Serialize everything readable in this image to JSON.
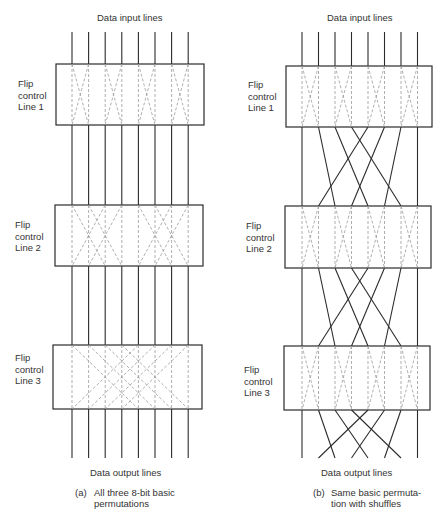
{
  "panels": [
    {
      "id": "a",
      "input_label": "Data input lines",
      "output_label": "Data output lines",
      "caption_tag": "(a)",
      "caption_line1": "All three 8-bit basic",
      "caption_line2": "permutations",
      "stages": [
        {
          "label_line1": "Flip",
          "label_line2": "control",
          "label_line3": "Line 1",
          "swap_distance": 1
        },
        {
          "label_line1": "Flip",
          "label_line2": "control",
          "label_line3": "Line 2",
          "swap_distance": 2
        },
        {
          "label_line1": "Flip",
          "label_line2": "control",
          "label_line3": "Line 3",
          "swap_distance": 4
        }
      ],
      "interconnect": "straight"
    },
    {
      "id": "b",
      "input_label": "Data input lines",
      "output_label": "Data output lines",
      "caption_tag": "(b)",
      "caption_line1": "Same basic permuta-",
      "caption_line2": "tion with shuffles",
      "stages": [
        {
          "label_line1": "Flip",
          "label_line2": "control",
          "label_line3": "Line 1",
          "swap_distance": 1
        },
        {
          "label_line1": "Flip",
          "label_line2": "control",
          "label_line3": "Line 2",
          "swap_distance": 1
        },
        {
          "label_line1": "Flip",
          "label_line2": "control",
          "label_line3": "Line 3",
          "swap_distance": 1
        }
      ],
      "interconnect": "perfect-shuffle"
    }
  ],
  "line_count": 8,
  "colors": {
    "solid": "#2b2b2b",
    "dashed": "#9a9a9a",
    "box": "#2b2b2b"
  }
}
